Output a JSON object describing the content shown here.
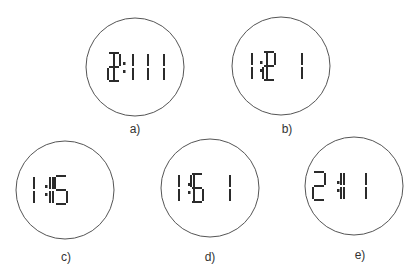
{
  "colors": {
    "ink": "#2b2b2b",
    "circle": "#555555",
    "background": "#ffffff"
  },
  "clocks": [
    {
      "id": "a",
      "label": "a)",
      "reading": "12:11",
      "cx": 135,
      "cy": 67,
      "r": 49,
      "label_x": 135,
      "label_y": 122,
      "glyphs": [
        {
          "x": 102,
          "segs": [
            "b",
            "c"
          ]
        },
        {
          "x": 108,
          "segs": [
            "a",
            "b",
            "g",
            "e",
            "d"
          ]
        },
        {
          "x": 123,
          "colon": true
        },
        {
          "x": 121,
          "segs": [
            "b",
            "c"
          ]
        },
        {
          "x": 136,
          "segs": [
            "b",
            "c"
          ]
        },
        {
          "x": 152,
          "segs": [
            "b",
            "c"
          ]
        }
      ]
    },
    {
      "id": "b",
      "label": "b)",
      "reading": "11:21",
      "cx": 281,
      "cy": 66,
      "r": 49,
      "label_x": 287,
      "label_y": 122,
      "glyphs": [
        {
          "x": 240,
          "segs": [
            "b",
            "c"
          ]
        },
        {
          "x": 255,
          "segs": [
            "b",
            "c"
          ]
        },
        {
          "x": 260,
          "colon": true
        },
        {
          "x": 263,
          "segs": [
            "a",
            "b",
            "g",
            "e",
            "d"
          ]
        },
        {
          "x": 290,
          "segs": [
            "b",
            "c"
          ]
        }
      ]
    },
    {
      "id": "c",
      "label": "c)",
      "reading": "1 1:15",
      "cx": 65,
      "cy": 190,
      "r": 49,
      "label_x": 66,
      "label_y": 250,
      "glyphs": [
        {
          "x": 22,
          "segs": [
            "b",
            "c"
          ]
        },
        {
          "x": 38,
          "segs": [
            "b",
            "c"
          ]
        },
        {
          "x": 45,
          "colon": true
        },
        {
          "x": 41,
          "segs": [
            "b",
            "c"
          ]
        },
        {
          "x": 55,
          "segs": [
            "a",
            "f",
            "g",
            "c",
            "d"
          ]
        }
      ]
    },
    {
      "id": "d",
      "label": "d)",
      "reading": "11:51",
      "cx": 210,
      "cy": 188,
      "r": 49,
      "label_x": 210,
      "label_y": 250,
      "glyphs": [
        {
          "x": 167,
          "segs": [
            "b",
            "c"
          ]
        },
        {
          "x": 182,
          "segs": [
            "b",
            "c"
          ]
        },
        {
          "x": 188,
          "colon": true
        },
        {
          "x": 191,
          "segs": [
            "a",
            "f",
            "g",
            "c",
            "d"
          ]
        },
        {
          "x": 218,
          "segs": [
            "b",
            "c"
          ]
        }
      ]
    },
    {
      "id": "e",
      "label": "e)",
      "reading": "2 1:1",
      "cx": 354,
      "cy": 186,
      "r": 49,
      "label_x": 360,
      "label_y": 248,
      "glyphs": [
        {
          "x": 313,
          "segs": [
            "a",
            "b",
            "g",
            "e",
            "d"
          ]
        },
        {
          "x": 329,
          "segs": [
            "b",
            "c"
          ]
        },
        {
          "x": 337,
          "colon": true
        },
        {
          "x": 332,
          "segs": [
            "b",
            "c"
          ]
        },
        {
          "x": 354,
          "segs": [
            "b",
            "c"
          ]
        }
      ]
    }
  ]
}
